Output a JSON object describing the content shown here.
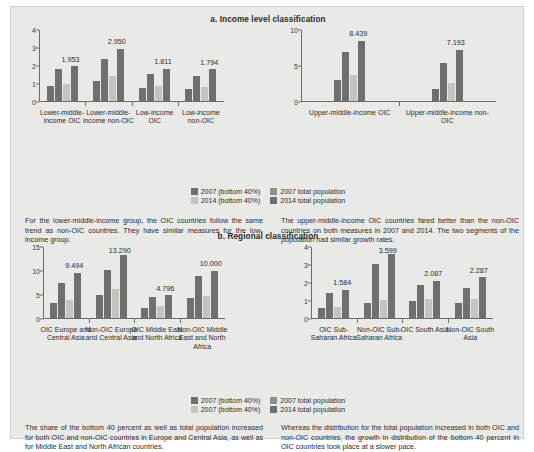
{
  "figure": {
    "background_color": "#e9e9e7",
    "series_colors": {
      "2007_bottom40": "#6f6f6f",
      "2007_total": "#6f6f6f",
      "2014_bottom40": "#c3c3c0",
      "2014_total": "#6f6f6f"
    }
  },
  "panel_a": {
    "title": "a. Income level classification",
    "legend": {
      "rows": [
        [
          {
            "label": "2007 (bottom 40%)",
            "color": "#6f6f6f"
          },
          {
            "label": "2007 total population",
            "color": "#8f8f8c"
          }
        ],
        [
          {
            "label": "2014 (bottom 40%)",
            "color": "#c3c3c0"
          },
          {
            "label": "2014 total population",
            "color": "#6f6f6f"
          }
        ]
      ]
    },
    "captions": [
      "For the lower-middle-income group, the OIC countries follow the same trend as non-OIC countries. They have similar measures for the low-income group.",
      "The upper-middle-income OIC countries fared better than the non-OIC countries on both measures in 2007 and 2014. The two segments of the population had similar growth rates."
    ]
  },
  "panel_b": {
    "title": "b. Regional classification",
    "legend": {
      "rows": [
        [
          {
            "label": "2007 (bottom 40%)",
            "color": "#6f6f6f"
          },
          {
            "label": "2007 total population",
            "color": "#8f8f8c"
          }
        ],
        [
          {
            "label": "2007 (bottom 40%)",
            "color": "#c3c3c0"
          },
          {
            "label": "2014 total population",
            "color": "#6f6f6f"
          }
        ]
      ]
    },
    "captions": [
      "The share of the bottom 40 percent as well as total population increased for both OIC and non-OIC countries in Europe and Central Asia, as well as for Middle East and North African countries.",
      "Whereas the distribution for the total population increased in both OIC and non-OIC countries, the growth in distribution of the bottom 40 percent in OIC countries took place at a slower pace."
    ]
  },
  "chart_data": [
    {
      "type": "bar",
      "id": "a-left",
      "title": "a. Income level classification",
      "panel": "a. Income level classification",
      "xlabel": "",
      "ylabel": "",
      "ylim": [
        0,
        4
      ],
      "yticks": [
        0,
        1,
        2,
        3,
        4
      ],
      "grid": false,
      "legend_position": "bottom-center",
      "categories": [
        "Lower-middle-income OIC",
        "Lower-middle-income non-OIC",
        "Low-income OIC",
        "Low-income non-OIC"
      ],
      "series": [
        {
          "name": "2007 (bottom 40%)",
          "values": [
            0.86,
            1.15,
            0.72,
            0.68
          ]
        },
        {
          "name": "2007 total population",
          "values": [
            1.8,
            2.34,
            1.55,
            1.41
          ]
        },
        {
          "name": "2014 (bottom 40%)",
          "values": [
            0.95,
            1.4,
            0.85,
            0.8
          ]
        },
        {
          "name": "2014 total population",
          "values": [
            1.953,
            2.95,
            1.811,
            1.794
          ]
        }
      ],
      "data_labels": [
        "1.953",
        "2.950",
        "1.811",
        "1.794"
      ]
    },
    {
      "type": "bar",
      "id": "a-right",
      "title": "a. Income level classification",
      "panel": "a. Income level classification",
      "xlabel": "",
      "ylabel": "",
      "ylim": [
        0,
        10
      ],
      "yticks": [
        0,
        5,
        10
      ],
      "grid": false,
      "legend_position": "bottom-center",
      "categories": [
        "Upper-middle-income OIC",
        "Upper-middle-income non-OIC"
      ],
      "series": [
        {
          "name": "2007 (bottom 40%)",
          "values": [
            2.95,
            1.7
          ]
        },
        {
          "name": "2007 total population",
          "values": [
            6.9,
            5.4
          ]
        },
        {
          "name": "2014 (bottom 40%)",
          "values": [
            3.6,
            2.5
          ]
        },
        {
          "name": "2014 total population",
          "values": [
            8.439,
            7.193
          ]
        }
      ],
      "data_labels": [
        "8.439",
        "7.193"
      ]
    },
    {
      "type": "bar",
      "id": "b-left",
      "title": "b. Regional classification",
      "panel": "b. Regional classification",
      "xlabel": "",
      "ylabel": "",
      "ylim": [
        0,
        15
      ],
      "yticks": [
        0,
        5,
        10,
        15
      ],
      "grid": false,
      "legend_position": "bottom-center",
      "categories": [
        "OIC Europe and Central Asia",
        "Non-OIC Europe and Central Asia",
        "OIC Middle East and North Africa",
        "Non-OIC Middle East and North Africa"
      ],
      "series": [
        {
          "name": "2007 (bottom 40%)",
          "values": [
            3.2,
            4.8,
            2.2,
            4.3
          ]
        },
        {
          "name": "2007 total population",
          "values": [
            7.4,
            10.1,
            4.4,
            8.8
          ]
        },
        {
          "name": "2014 (bottom 40%)",
          "values": [
            3.9,
            6.2,
            2.5,
            4.7
          ]
        },
        {
          "name": "2014 total population",
          "values": [
            9.494,
            13.29,
            4.796,
            10.0
          ]
        }
      ],
      "data_labels": [
        "9.494",
        "13.290",
        "4.796",
        "10.000"
      ]
    },
    {
      "type": "bar",
      "id": "b-right",
      "title": "b. Regional classification",
      "panel": "b. Regional classification",
      "xlabel": "",
      "ylabel": "",
      "ylim": [
        0,
        4
      ],
      "yticks": [
        0,
        1,
        2,
        3,
        4
      ],
      "grid": false,
      "legend_position": "bottom-center",
      "categories": [
        "OIC Sub-Saharan Africa",
        "Non-OIC Sub-Saharan Africa",
        "OIC South Asia",
        "Non-OIC South Asia"
      ],
      "series": [
        {
          "name": "2007 (bottom 40%)",
          "values": [
            0.55,
            0.86,
            0.97,
            0.84
          ]
        },
        {
          "name": "2007 total population",
          "values": [
            1.4,
            3.02,
            1.86,
            1.7
          ]
        },
        {
          "name": "2014 (bottom 40%)",
          "values": [
            0.62,
            1.0,
            1.05,
            1.05
          ]
        },
        {
          "name": "2014 total population",
          "values": [
            1.584,
            3.599,
            2.087,
            2.287
          ]
        }
      ],
      "data_labels": [
        "1.584",
        "3.599",
        "2.087",
        "2.287"
      ]
    }
  ]
}
